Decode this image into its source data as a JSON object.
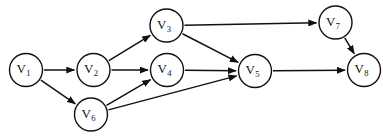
{
  "figure": {
    "title_fragment": "        ",
    "background_color": "#ffffff",
    "stroke_color": "#111111",
    "width": 383,
    "height": 140
  },
  "chart_data": {
    "type": "diagram",
    "diagram_kind": "directed-acyclic-graph",
    "title": "",
    "xlabel": "",
    "ylabel": "",
    "grid": false,
    "legend": "none",
    "node_radius": 16.5,
    "nodes": [
      {
        "id": "V1",
        "base": "V",
        "sub": "1",
        "cx": 26,
        "cy": 70
      },
      {
        "id": "V2",
        "base": "V",
        "sub": "2",
        "cx": 93.5,
        "cy": 70
      },
      {
        "id": "V3",
        "base": "V",
        "sub": "3",
        "cx": 166.5,
        "cy": 25.5
      },
      {
        "id": "V4",
        "base": "V",
        "sub": "4",
        "cx": 167,
        "cy": 70
      },
      {
        "id": "V5",
        "base": "V",
        "sub": "5",
        "cx": 255,
        "cy": 71
      },
      {
        "id": "V6",
        "base": "V",
        "sub": "6",
        "cx": 91,
        "cy": 114.5
      },
      {
        "id": "V7",
        "base": "V",
        "sub": "7",
        "cx": 335.5,
        "cy": 22.5
      },
      {
        "id": "V8",
        "base": "V",
        "sub": "8",
        "cx": 364,
        "cy": 70
      }
    ],
    "edges": [
      {
        "from": "V1",
        "to": "V2",
        "directed": true
      },
      {
        "from": "V1",
        "to": "V6",
        "directed": true
      },
      {
        "from": "V2",
        "to": "V3",
        "directed": true
      },
      {
        "from": "V2",
        "to": "V4",
        "directed": true
      },
      {
        "from": "V3",
        "to": "V5",
        "directed": true
      },
      {
        "from": "V3",
        "to": "V7",
        "directed": true
      },
      {
        "from": "V4",
        "to": "V5",
        "directed": true
      },
      {
        "from": "V5",
        "to": "V8",
        "directed": true
      },
      {
        "from": "V6",
        "to": "V4",
        "directed": true
      },
      {
        "from": "V6",
        "to": "V5",
        "directed": true
      },
      {
        "from": "V7",
        "to": "V8",
        "directed": true
      }
    ],
    "node_count": 8,
    "edge_count": 11
  }
}
